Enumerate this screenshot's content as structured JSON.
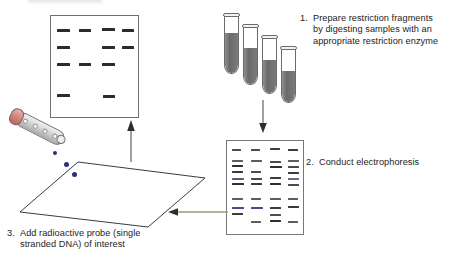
{
  "diagram": {
    "top_caption": ""
  },
  "steps": [
    {
      "number": "1.",
      "text": "Prepare restriction fragments\nby digesting samples with an\nappropriate restriction enzyme"
    },
    {
      "number": "2.",
      "text": "Conduct electrophoresis"
    },
    {
      "number": "3.",
      "text": "Add radioactive probe (single\nstranded DNA) of interest"
    }
  ],
  "colors": {
    "band_dark": "#2b2b2b",
    "band_blue": "#4a4a8c",
    "band_gray": "#555555",
    "drop_blue": "#2c2f7a",
    "tube_fill": "#6a6a6a",
    "probe_cap": "#d07e78",
    "arrow_gray": "#8a8a8a",
    "outline": "#6e6e6e",
    "text": "#1c1c1c"
  },
  "film": {
    "label": "autoradiograph-film",
    "lanes": 4,
    "bands": [
      {
        "lane": 0,
        "x": 6,
        "y": 13,
        "w": 13
      },
      {
        "lane": 1,
        "x": 28,
        "y": 13,
        "w": 12
      },
      {
        "lane": 2,
        "x": 51,
        "y": 12,
        "w": 13
      },
      {
        "lane": 3,
        "x": 71,
        "y": 13,
        "w": 12
      },
      {
        "lane": 0,
        "x": 6,
        "y": 30,
        "w": 13
      },
      {
        "lane": 2,
        "x": 51,
        "y": 30,
        "w": 13
      },
      {
        "lane": 3,
        "x": 71,
        "y": 30,
        "w": 12
      },
      {
        "lane": 0,
        "x": 6,
        "y": 47,
        "w": 13
      },
      {
        "lane": 1,
        "x": 28,
        "y": 47,
        "w": 12
      },
      {
        "lane": 2,
        "x": 51,
        "y": 47,
        "w": 13
      },
      {
        "lane": 0,
        "x": 6,
        "y": 78,
        "w": 13
      },
      {
        "lane": 2,
        "x": 52,
        "y": 79,
        "w": 12
      }
    ]
  },
  "gel": {
    "label": "electrophoresis-gel",
    "lanes": 4,
    "lane_x": [
      5,
      24,
      43,
      61
    ],
    "bands": [
      {
        "lane": 0,
        "y": 8,
        "w": 9,
        "color": "#4d4d4d"
      },
      {
        "lane": 1,
        "y": 8,
        "w": 9,
        "color": "#4d4d4d"
      },
      {
        "lane": 2,
        "y": 7,
        "w": 10,
        "color": "#3c3c3c"
      },
      {
        "lane": 3,
        "y": 8,
        "w": 10,
        "color": "#3c3c3c"
      },
      {
        "lane": 0,
        "y": 19,
        "w": 11,
        "color": "#5c5c5c"
      },
      {
        "lane": 1,
        "y": 19,
        "w": 11,
        "color": "#5c5c5c"
      },
      {
        "lane": 2,
        "y": 20,
        "w": 11,
        "color": "#4a4a4a"
      },
      {
        "lane": 3,
        "y": 19,
        "w": 11,
        "color": "#5c5c5c"
      },
      {
        "lane": 0,
        "y": 24,
        "w": 11,
        "color": "#2f2f2f"
      },
      {
        "lane": 2,
        "y": 25,
        "w": 12,
        "color": "#2f2f2f"
      },
      {
        "lane": 3,
        "y": 25,
        "w": 11,
        "color": "#4a4a4a"
      },
      {
        "lane": 0,
        "y": 30,
        "w": 11,
        "color": "#3b3b3b"
      },
      {
        "lane": 1,
        "y": 30,
        "w": 10,
        "color": "#4d4d4d"
      },
      {
        "lane": 3,
        "y": 31,
        "w": 11,
        "color": "#3b3b3b"
      },
      {
        "lane": 0,
        "y": 37,
        "w": 12,
        "color": "#5a5a78"
      },
      {
        "lane": 1,
        "y": 37,
        "w": 11,
        "color": "#4a4a4a"
      },
      {
        "lane": 2,
        "y": 36,
        "w": 11,
        "color": "#3b3b3b"
      },
      {
        "lane": 3,
        "y": 37,
        "w": 11,
        "color": "#6a6a7e"
      },
      {
        "lane": 0,
        "y": 42,
        "w": 12,
        "color": "#2f2f2f"
      },
      {
        "lane": 1,
        "y": 42,
        "w": 11,
        "color": "#3b3b3b"
      },
      {
        "lane": 2,
        "y": 42,
        "w": 11,
        "color": "#2f2f2f"
      },
      {
        "lane": 3,
        "y": 43,
        "w": 11,
        "color": "#4a4a4a"
      },
      {
        "lane": 0,
        "y": 57,
        "w": 11,
        "color": "#5c5c5c"
      },
      {
        "lane": 1,
        "y": 57,
        "w": 10,
        "color": "#5c5c5c"
      },
      {
        "lane": 2,
        "y": 57,
        "w": 11,
        "color": "#5c5c5c"
      },
      {
        "lane": 3,
        "y": 57,
        "w": 10,
        "color": "#5c5c5c"
      },
      {
        "lane": 0,
        "y": 66,
        "w": 12,
        "color": "#4a4a8c"
      },
      {
        "lane": 1,
        "y": 66,
        "w": 12,
        "color": "#4a4a8c"
      },
      {
        "lane": 2,
        "y": 66,
        "w": 11,
        "color": "#3b3b3b"
      },
      {
        "lane": 3,
        "y": 65,
        "w": 11,
        "color": "#3b3b3b"
      },
      {
        "lane": 0,
        "y": 72,
        "w": 11,
        "color": "#3b3b3b"
      },
      {
        "lane": 2,
        "y": 73,
        "w": 11,
        "color": "#4d4d4d"
      },
      {
        "lane": 1,
        "y": 80,
        "w": 10,
        "color": "#5c5c5c"
      },
      {
        "lane": 2,
        "y": 79,
        "w": 11,
        "color": "#2f2f2f"
      },
      {
        "lane": 3,
        "y": 80,
        "w": 10,
        "color": "#5c5c5c"
      }
    ]
  },
  "tubes": [
    {
      "x": 224,
      "y": 14,
      "h": 60,
      "fill_h": 40
    },
    {
      "x": 243,
      "y": 25,
      "h": 60,
      "fill_h": 36
    },
    {
      "x": 262,
      "y": 36,
      "h": 58,
      "fill_h": 33
    },
    {
      "x": 281,
      "y": 47,
      "h": 56,
      "fill_h": 31
    }
  ],
  "probe": {
    "label": "radioactive-probe-vial",
    "dots": [
      14,
      25,
      36,
      47
    ]
  },
  "membrane": {
    "label": "nylon-membrane-blot",
    "points": "0,52 58,2 185,18 128,67",
    "drops": [
      {
        "x": 44,
        "y": 2,
        "r": 2.6
      },
      {
        "x": 52,
        "y": 12,
        "r": 2.6
      },
      {
        "x": 33,
        "y": -9,
        "r": 2.2
      }
    ]
  },
  "arrows": [
    {
      "name": "arrow-tubes-to-gel",
      "direction": "down"
    },
    {
      "name": "arrow-gel-to-membrane",
      "direction": "left"
    },
    {
      "name": "arrow-membrane-to-film",
      "direction": "up"
    }
  ]
}
